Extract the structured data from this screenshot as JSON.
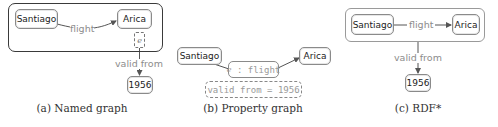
{
  "figure": {
    "panels": [
      {
        "id": "a",
        "caption": "(a) Named graph",
        "nodes": {
          "source": "Santiago",
          "target": "Arica",
          "value": "1956"
        },
        "edge_label": "flight",
        "graph_name": "e",
        "meta_edge_label": "valid from"
      },
      {
        "id": "b",
        "caption": "(b) Property graph",
        "nodes": {
          "source": "Santiago",
          "target": "Arica"
        },
        "edge_id": "e",
        "edge_sep": " : ",
        "edge_label": "flight",
        "property": "valid from = 1956"
      },
      {
        "id": "c",
        "caption": "(c) RDF*",
        "nodes": {
          "source": "Santiago",
          "target": "Arica",
          "value": "1956"
        },
        "edge_label": "flight",
        "meta_edge_label": "valid from"
      }
    ],
    "colors": {
      "node_border": "#8a8a8a",
      "edge": "#555555",
      "edge_label": "#8c8c8c",
      "named_graph_border": "#3a3a3a",
      "caption": "#333333"
    }
  }
}
